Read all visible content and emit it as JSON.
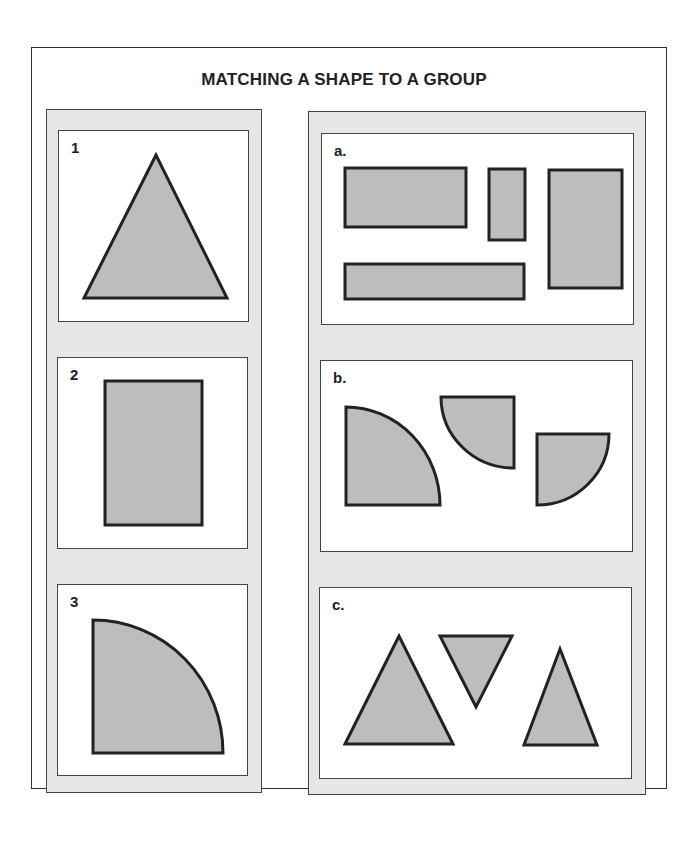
{
  "title": "MATCHING A SHAPE TO A GROUP",
  "colors": {
    "shape_fill": "#bdbdbd",
    "shape_stroke": "#222222",
    "column_bg": "#e6e6e6"
  },
  "left_column": {
    "items": [
      {
        "label": "1",
        "shape": "triangle"
      },
      {
        "label": "2",
        "shape": "rectangle"
      },
      {
        "label": "3",
        "shape": "quarter-circle"
      }
    ]
  },
  "right_column": {
    "groups": [
      {
        "label": "a.",
        "shape_type": "rectangles",
        "count": 4
      },
      {
        "label": "b.",
        "shape_type": "quarter-circles",
        "count": 3
      },
      {
        "label": "c.",
        "shape_type": "triangles",
        "count": 3
      }
    ]
  }
}
